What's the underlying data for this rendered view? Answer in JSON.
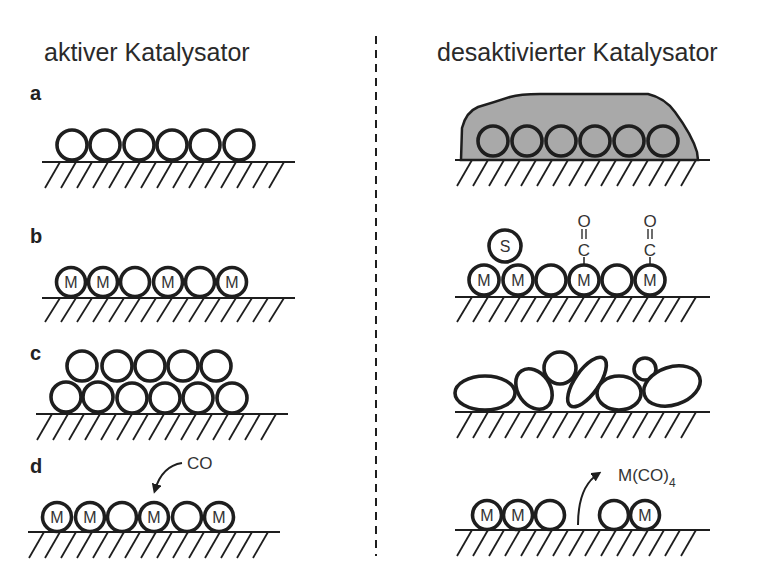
{
  "headers": {
    "active": "aktiver Katalysator",
    "deactivated": "desaktivierter Katalysator"
  },
  "panels": [
    {
      "label": "a",
      "description": "Vergiftung durch Ablagerung (Fouling)"
    },
    {
      "label": "b",
      "description": "Vergiftung durch Adsorption von S und CO"
    },
    {
      "label": "c",
      "description": "Sintern / Strukturveränderung"
    },
    {
      "label": "d",
      "description": "Verlust aktiver Metalle als flüchtiges Carbonyl"
    }
  ],
  "atoms": {
    "metal": "M",
    "sulfur": "S",
    "carbon": "C",
    "oxygen": "O"
  },
  "annotations": {
    "co": "CO",
    "carbonyl_main": "M(CO)",
    "carbonyl_sub": "4"
  },
  "colors": {
    "stroke": "#1e1e1e",
    "deposit_fill": "#a9a9a9",
    "background": "#ffffff"
  }
}
